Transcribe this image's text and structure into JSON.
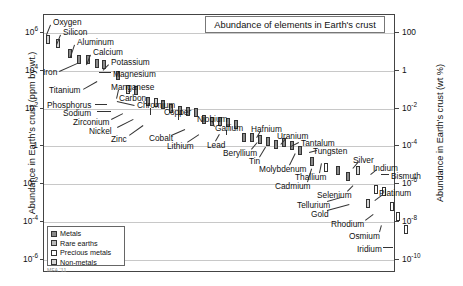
{
  "title": "Abundance of elements in Earth's crust",
  "watermark": "MFA '11",
  "axes": {
    "left_label": "Abundance in Earth's crust (ppm by wt.)",
    "right_label": "Abundance in Earth's crust (wt %)",
    "left_ticks": [
      "10^6",
      "10^4",
      "10^2",
      "1",
      "10^-2",
      "10^-4",
      "10^-6"
    ],
    "right_ticks": [
      "100",
      "1",
      "10^-2",
      "10^-4",
      "10^-6",
      "10^-8",
      "10^-10"
    ]
  },
  "legend": {
    "items": [
      {
        "label": "Metals",
        "color": "#8a8a8a",
        "key": "metal"
      },
      {
        "label": "Rare earths",
        "color": "#b9b9b9",
        "key": "rare"
      },
      {
        "label": "Precious metals",
        "color": "#ffffff",
        "key": "precious"
      },
      {
        "label": "Non-metals",
        "color": "#d5d5d5",
        "key": "non"
      }
    ]
  },
  "chart_data": {
    "type": "scatter",
    "title": "Abundance of elements in Earth's crust",
    "xlabel": "",
    "ylabel": "Abundance in Earth's crust (ppm by wt.)",
    "ylabel_right": "Abundance in Earth's crust (wt %)",
    "yscale": "log",
    "ylim": [
      1e-05,
      10000000.0
    ],
    "grid": true,
    "legend_position": "bottom-left",
    "units": "ppm by wt.",
    "labeled_elements": [
      "Oxygen",
      "Silicon",
      "Aluminum",
      "Calcium",
      "Potassium",
      "Magnesium",
      "Iron",
      "Titanium",
      "Manganese",
      "Phosphorus",
      "Carbon",
      "Chromium",
      "Sodium",
      "Zirconium",
      "Nickel",
      "Zinc",
      "Copper",
      "Niobium",
      "Cobalt",
      "Lithium",
      "Gallium",
      "Lead",
      "Beryllium",
      "Hafnium",
      "Tin",
      "Uranium",
      "Molybdenum",
      "Tantalum",
      "Tungsten",
      "Thallium",
      "Cadmium",
      "Silver",
      "Indium",
      "Bismuth",
      "Selenium",
      "Tellurium",
      "Platinum",
      "Gold",
      "Rhodium",
      "Osmium",
      "Iridium"
    ],
    "points": [
      {
        "name": "Oxygen",
        "value": 460000,
        "class": "non",
        "x": 2
      },
      {
        "name": "Silicon",
        "value": 270000,
        "class": "non",
        "x": 12
      },
      {
        "name": "Aluminum",
        "value": 82000,
        "class": "metal",
        "x": 24
      },
      {
        "name": "Iron",
        "value": 41000,
        "class": "metal",
        "x": 33
      },
      {
        "name": "Calcium",
        "value": 41000,
        "class": "metal",
        "x": 42
      },
      {
        "name": "Magnesium",
        "value": 23000,
        "class": "metal",
        "x": 51
      },
      {
        "name": "Potassium",
        "value": 21000,
        "class": "metal",
        "x": 58
      },
      {
        "name": "Titanium",
        "value": 5600,
        "class": "metal",
        "x": 72
      },
      {
        "name": "Phosphorus",
        "value": 1000,
        "class": "non",
        "x": 82
      },
      {
        "name": "Manganese",
        "value": 950,
        "class": "metal",
        "x": 90
      },
      {
        "name": "Sodium",
        "value": 230,
        "class": "metal",
        "x": 102
      },
      {
        "name": "Carbon",
        "value": 200,
        "class": "non",
        "x": 110
      },
      {
        "name": "Zirconium",
        "value": 160,
        "class": "metal",
        "x": 117
      },
      {
        "name": "Chromium",
        "value": 100,
        "class": "metal",
        "x": 125
      },
      {
        "name": "Nickel",
        "value": 84,
        "class": "metal",
        "x": 134
      },
      {
        "name": "Zinc",
        "value": 70,
        "class": "metal",
        "x": 142
      },
      {
        "name": "Copper",
        "value": 60,
        "class": "metal",
        "x": 150
      },
      {
        "name": "Cobalt",
        "value": 25,
        "class": "metal",
        "x": 158
      },
      {
        "name": "Lithium",
        "value": 20,
        "class": "metal",
        "x": 166
      },
      {
        "name": "Niobium",
        "value": 20,
        "class": "metal",
        "x": 174
      },
      {
        "name": "Gallium",
        "value": 18,
        "class": "metal",
        "x": 182
      },
      {
        "name": "Lead",
        "value": 14,
        "class": "metal",
        "x": 190
      },
      {
        "name": "Beryllium",
        "value": 2.8,
        "class": "metal",
        "x": 198
      },
      {
        "name": "Hafnium",
        "value": 3,
        "class": "metal",
        "x": 206
      },
      {
        "name": "Tin",
        "value": 2.3,
        "class": "metal",
        "x": 214
      },
      {
        "name": "Uranium",
        "value": 1.8,
        "class": "metal",
        "x": 222
      },
      {
        "name": "Molybdenum",
        "value": 1.2,
        "class": "metal",
        "x": 230
      },
      {
        "name": "Tantalum",
        "value": 1.7,
        "class": "metal",
        "x": 238
      },
      {
        "name": "Tungsten",
        "value": 1.1,
        "class": "metal",
        "x": 246
      },
      {
        "name": "Thallium",
        "value": 0.6,
        "class": "metal",
        "x": 254
      },
      {
        "name": "Cadmium",
        "value": 0.15,
        "class": "metal",
        "x": 266
      },
      {
        "name": "Silver",
        "value": 0.075,
        "class": "precious",
        "x": 280
      },
      {
        "name": "Indium",
        "value": 0.05,
        "class": "metal",
        "x": 292
      },
      {
        "name": "Bismuth",
        "value": 0.025,
        "class": "metal",
        "x": 302
      },
      {
        "name": "Selenium",
        "value": 0.05,
        "class": "non",
        "x": 312
      },
      {
        "name": "Tellurium",
        "value": 0.001,
        "class": "non",
        "x": 322
      },
      {
        "name": "Platinum",
        "value": 0.005,
        "class": "precious",
        "x": 330
      },
      {
        "name": "Gold",
        "value": 0.004,
        "class": "precious",
        "x": 338
      },
      {
        "name": "Rhodium",
        "value": 0.0007,
        "class": "precious",
        "x": 346
      },
      {
        "name": "Osmium",
        "value": 0.0002,
        "class": "precious",
        "x": 352
      },
      {
        "name": "Iridium",
        "value": 4e-05,
        "class": "precious",
        "x": 360
      }
    ]
  },
  "labels_layout": [
    {
      "name": "Oxygen",
      "lx": 52,
      "ly": 17,
      "leader": {
        "x1": 50,
        "y1": 24,
        "x2": 46,
        "y2": 34
      }
    },
    {
      "name": "Silicon",
      "lx": 62,
      "ly": 27,
      "leader": {
        "x1": 60,
        "y1": 34,
        "x2": 56,
        "y2": 44
      }
    },
    {
      "name": "Aluminum",
      "lx": 76,
      "ly": 37,
      "leader": {
        "x1": 74,
        "y1": 44,
        "x2": 70,
        "y2": 56
      }
    },
    {
      "name": "Calcium",
      "lx": 92,
      "ly": 47,
      "leader": {
        "x1": 90,
        "y1": 54,
        "x2": 86,
        "y2": 64
      }
    },
    {
      "name": "Potassium",
      "lx": 110,
      "ly": 57,
      "leader": {
        "x1": 108,
        "y1": 64,
        "x2": 102,
        "y2": 70
      }
    },
    {
      "name": "Iron",
      "lx": 42,
      "ly": 67,
      "leader": {
        "x1": 58,
        "y1": 70,
        "x2": 76,
        "y2": 62
      }
    },
    {
      "name": "Magnesium",
      "lx": 112,
      "ly": 69,
      "leader": {
        "x1": 110,
        "y1": 72,
        "x2": 98,
        "y2": 72
      }
    },
    {
      "name": "Titanium",
      "lx": 48,
      "ly": 85,
      "leader": {
        "x1": 82,
        "y1": 88,
        "x2": 96,
        "y2": 80
      }
    },
    {
      "name": "Manganese",
      "lx": 110,
      "ly": 82,
      "leader": {
        "x1": 118,
        "y1": 89,
        "x2": 116,
        "y2": 98
      }
    },
    {
      "name": "Carbon",
      "lx": 118,
      "ly": 93,
      "leader": {
        "x1": 116,
        "y1": 100,
        "x2": 134,
        "y2": 104
      }
    },
    {
      "name": "Phosphorus",
      "lx": 46,
      "ly": 100,
      "leader": {
        "x1": 94,
        "y1": 103,
        "x2": 106,
        "y2": 103
      }
    },
    {
      "name": "Chromium",
      "lx": 136,
      "ly": 100,
      "leader": {
        "x1": 150,
        "y1": 107,
        "x2": 150,
        "y2": 114
      }
    },
    {
      "name": "Sodium",
      "lx": 62,
      "ly": 108,
      "leader": {
        "x1": 96,
        "y1": 110,
        "x2": 110,
        "y2": 110
      }
    },
    {
      "name": "Copper",
      "lx": 163,
      "ly": 107,
      "leader": {
        "x1": 178,
        "y1": 113,
        "x2": 178,
        "y2": 119
      }
    },
    {
      "name": "Zirconium",
      "lx": 72,
      "ly": 117,
      "leader": {
        "x1": 110,
        "y1": 118,
        "x2": 122,
        "y2": 112
      }
    },
    {
      "name": "Niobium",
      "lx": 196,
      "ly": 114,
      "leader": {
        "x1": 212,
        "y1": 120,
        "x2": 214,
        "y2": 126
      }
    },
    {
      "name": "Nickel",
      "lx": 88,
      "ly": 126,
      "leader": {
        "x1": 116,
        "y1": 126,
        "x2": 132,
        "y2": 118
      }
    },
    {
      "name": "Gallium",
      "lx": 214,
      "ly": 123,
      "leader": {
        "x1": 226,
        "y1": 129,
        "x2": 226,
        "y2": 134
      }
    },
    {
      "name": "Hafnium",
      "lx": 250,
      "ly": 124,
      "leader": {
        "x1": 260,
        "y1": 130,
        "x2": 256,
        "y2": 137
      }
    },
    {
      "name": "Zinc",
      "lx": 110,
      "ly": 134,
      "leader": {
        "x1": 128,
        "y1": 134,
        "x2": 142,
        "y2": 124
      }
    },
    {
      "name": "Cobalt",
      "lx": 148,
      "ly": 133,
      "leader": {
        "x1": 170,
        "y1": 134,
        "x2": 184,
        "y2": 128
      }
    },
    {
      "name": "Uranium",
      "lx": 276,
      "ly": 131,
      "leader": {
        "x1": 286,
        "y1": 137,
        "x2": 280,
        "y2": 144
      }
    },
    {
      "name": "Lithium",
      "lx": 166,
      "ly": 141,
      "leader": {
        "x1": 186,
        "y1": 141,
        "x2": 198,
        "y2": 133
      }
    },
    {
      "name": "Lead",
      "lx": 206,
      "ly": 140,
      "leader": {
        "x1": 214,
        "y1": 140,
        "x2": 218,
        "y2": 133
      }
    },
    {
      "name": "Tantalum",
      "lx": 300,
      "ly": 138,
      "leader": {
        "x1": 298,
        "y1": 142,
        "x2": 290,
        "y2": 146
      }
    },
    {
      "name": "Beryllium",
      "lx": 222,
      "ly": 148,
      "leader": {
        "x1": 250,
        "y1": 148,
        "x2": 256,
        "y2": 141
      }
    },
    {
      "name": "Tungsten",
      "lx": 312,
      "ly": 146,
      "leader": {
        "x1": 316,
        "y1": 150,
        "x2": 308,
        "y2": 152
      }
    },
    {
      "name": "Tin",
      "lx": 248,
      "ly": 156,
      "leader": {
        "x1": 258,
        "y1": 156,
        "x2": 264,
        "y2": 146
      }
    },
    {
      "name": "Silver",
      "lx": 352,
      "ly": 155,
      "leader": {
        "x1": 358,
        "y1": 161,
        "x2": 352,
        "y2": 168
      }
    },
    {
      "name": "Molybdenum",
      "lx": 258,
      "ly": 164,
      "leader": {
        "x1": 288,
        "y1": 164,
        "x2": 294,
        "y2": 152
      }
    },
    {
      "name": "Indium",
      "lx": 372,
      "ly": 163,
      "leader": {
        "x1": 376,
        "y1": 169,
        "x2": 370,
        "y2": 174
      }
    },
    {
      "name": "Thallium",
      "lx": 294,
      "ly": 172,
      "leader": {
        "x1": 318,
        "y1": 172,
        "x2": 320,
        "y2": 162
      }
    },
    {
      "name": "Bismuth",
      "lx": 390,
      "ly": 171,
      "leader": {
        "x1": 388,
        "y1": 174,
        "x2": 380,
        "y2": 174
      }
    },
    {
      "name": "Cadmium",
      "lx": 274,
      "ly": 181,
      "leader": {
        "x1": 306,
        "y1": 181,
        "x2": 310,
        "y2": 168
      }
    },
    {
      "name": "Selenium",
      "lx": 316,
      "ly": 190,
      "leader": {
        "x1": 346,
        "y1": 190,
        "x2": 352,
        "y2": 184
      }
    },
    {
      "name": "Platinum",
      "lx": 378,
      "ly": 188,
      "leader": {
        "x1": 382,
        "y1": 194,
        "x2": 374,
        "y2": 200
      }
    },
    {
      "name": "Tellurium",
      "lx": 296,
      "ly": 200,
      "leader": {
        "x1": 326,
        "y1": 200,
        "x2": 340,
        "y2": 196
      }
    },
    {
      "name": "Gold",
      "lx": 310,
      "ly": 209,
      "leader": {
        "x1": 326,
        "y1": 209,
        "x2": 348,
        "y2": 203
      }
    },
    {
      "name": "Rhodium",
      "lx": 330,
      "ly": 219,
      "leader": {
        "x1": 364,
        "y1": 219,
        "x2": 372,
        "y2": 213
      }
    },
    {
      "name": "Osmium",
      "lx": 348,
      "ly": 231,
      "leader": {
        "x1": 378,
        "y1": 231,
        "x2": 380,
        "y2": 224
      }
    },
    {
      "name": "Iridium",
      "lx": 356,
      "ly": 244,
      "leader": {
        "x1": 382,
        "y1": 246,
        "x2": 392,
        "y2": 246
      }
    }
  ]
}
